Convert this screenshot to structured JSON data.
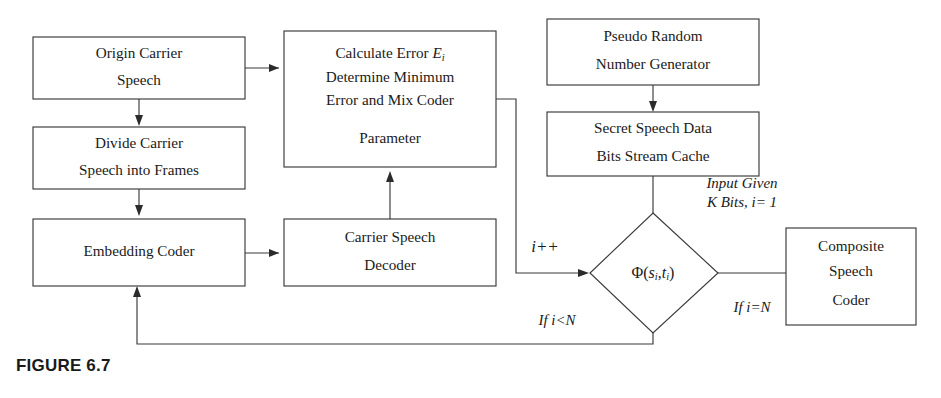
{
  "figure": {
    "caption": "FIGURE 6.7",
    "colors": {
      "stroke": "#3a3a3a",
      "text": "#1a1a1a",
      "background": "#ffffff"
    }
  },
  "nodes": {
    "origin_carrier_speech": {
      "shape": "rect",
      "lines": [
        "Origin Carrier",
        "Speech"
      ]
    },
    "divide_carrier_speech": {
      "shape": "rect",
      "lines": [
        "Divide Carrier",
        "Speech into Frames"
      ]
    },
    "embedding_coder": {
      "shape": "rect",
      "lines": [
        "Embedding Coder"
      ]
    },
    "calculate_error": {
      "shape": "rect",
      "lines": [
        "Calculate Error E",
        "Determine Minimum",
        "Error and Mix Coder",
        "Parameter"
      ],
      "line1_prefix": "Calculate Error ",
      "line1_symbol": "E",
      "line1_subscript": "i"
    },
    "carrier_speech_decoder": {
      "shape": "rect",
      "lines": [
        "Carrier Speech",
        "Decoder"
      ]
    },
    "pseudo_random_generator": {
      "shape": "rect",
      "lines": [
        "Pseudo Random",
        "Number Generator"
      ]
    },
    "secret_speech_cache": {
      "shape": "rect",
      "lines": [
        "Secret Speech Data",
        "Bits Stream Cache"
      ]
    },
    "decision_phi": {
      "shape": "diamond",
      "label_prefix": "Φ(",
      "label_s": "s",
      "label_s_sub": "i",
      "label_comma": ",",
      "label_t": "t",
      "label_t_sub": "i",
      "label_suffix": ")"
    },
    "composite_speech_coder": {
      "shape": "rect",
      "lines": [
        "Composite",
        "Speech",
        "Coder"
      ]
    }
  },
  "edge_labels": {
    "increment": "i++",
    "if_less_than_n": "If i<N",
    "if_equal_n": "If i=N",
    "input_given_line1": "Input Given",
    "input_given_line2": "K Bits, i= 1"
  }
}
